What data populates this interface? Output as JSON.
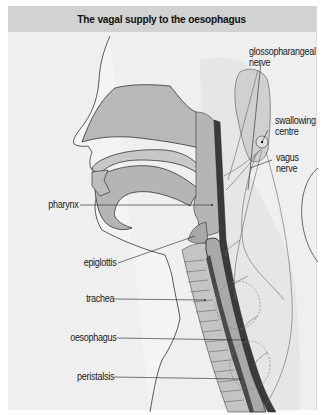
{
  "figure": {
    "title": "The vagal supply to the oesophagus",
    "colors": {
      "background": "#efefef",
      "title_bar": "#d2d2d2",
      "tissue_fill": "#b5b5b5",
      "light_fill": "#d8d8d8",
      "dark_wall": "#3a3a3a",
      "outline": "#333333"
    },
    "labels_left": [
      {
        "id": "pharynx",
        "text": "pharynx"
      },
      {
        "id": "epiglottis",
        "text": "epiglottis"
      },
      {
        "id": "trachea",
        "text": "trachea"
      },
      {
        "id": "oesophagus",
        "text": "oesophagus"
      },
      {
        "id": "peristalsis",
        "text": "peristalsis"
      }
    ],
    "labels_right": [
      {
        "id": "glossopharangeal-nerve",
        "line1": "glossopharangeal",
        "line2": "nerve"
      },
      {
        "id": "swallowing-centre",
        "line1": "swallowing",
        "line2": "centre"
      },
      {
        "id": "vagus-nerve",
        "line1": "vagus",
        "line2": "nerve"
      }
    ]
  }
}
